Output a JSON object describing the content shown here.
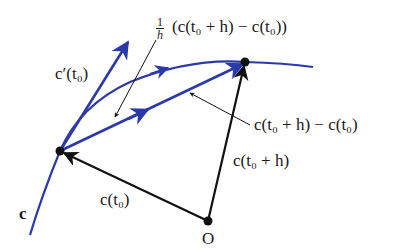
{
  "diagram": {
    "colors": {
      "curve": "#2b3aa8",
      "vector": "#111111",
      "background": "#ffffff"
    },
    "points": {
      "c_t0": {
        "x": 60,
        "y": 151
      },
      "c_t0_plus_h": {
        "x": 245,
        "y": 62
      },
      "origin": {
        "x": 208,
        "y": 221
      }
    },
    "labels": {
      "curve": "c",
      "tangent": "c′(t₀)",
      "scaled_secant_prefix_num": "1",
      "scaled_secant_prefix_den": "h",
      "scaled_secant": "(c(t₀ + h) − c(t₀))",
      "secant": "c(t₀ + h) − c(t₀)",
      "position_t0_plus_h": "c(t₀ + h)",
      "position_t0": "c(t₀)",
      "origin": "O"
    }
  }
}
